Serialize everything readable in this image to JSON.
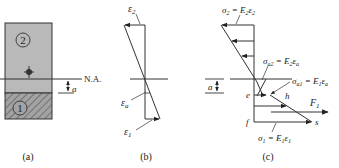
{
  "panel_a": {
    "caption": "(a)",
    "region2_label": "2",
    "region1_label": "1",
    "neutral_axis_label": "N.A.",
    "offset_label": "a",
    "colors": {
      "region2_fill": "#b9b9b9",
      "region1_fill": "#9d9d9d",
      "stroke": "#333333"
    }
  },
  "panel_b": {
    "caption": "(b)",
    "top_strain": "ε",
    "top_strain_sub": "2",
    "axis_strain": "ε",
    "axis_strain_sub": "a",
    "bottom_strain": "ε",
    "bottom_strain_sub": "1"
  },
  "panel_c": {
    "caption": "(c)",
    "sigma2_eq": {
      "lhs": "σ",
      "lhs_sub": "2",
      "rhs": " = E",
      "rhs_sub": "2",
      "tail": "ε",
      "tail_sub": "2"
    },
    "sigma_a2_eq": {
      "lhs": "σ",
      "lhs_sub": "a2",
      "rhs": " = E",
      "rhs_sub": "2",
      "tail": "ε",
      "tail_sub": "a"
    },
    "sigma_a1_eq": {
      "lhs": "σ",
      "lhs_sub": "a1",
      "rhs": " = E",
      "rhs_sub": "1",
      "tail": "ε",
      "tail_sub": "a"
    },
    "sigma1_eq": {
      "lhs": "σ",
      "lhs_sub": "1",
      "rhs": " = E",
      "rhs_sub": "1",
      "tail": "ε",
      "tail_sub": "1"
    },
    "point_e": "e",
    "point_h": "h",
    "point_f": "f",
    "point_s": "s",
    "force_label": "F",
    "force_sub": "1",
    "offset_label": "a"
  }
}
